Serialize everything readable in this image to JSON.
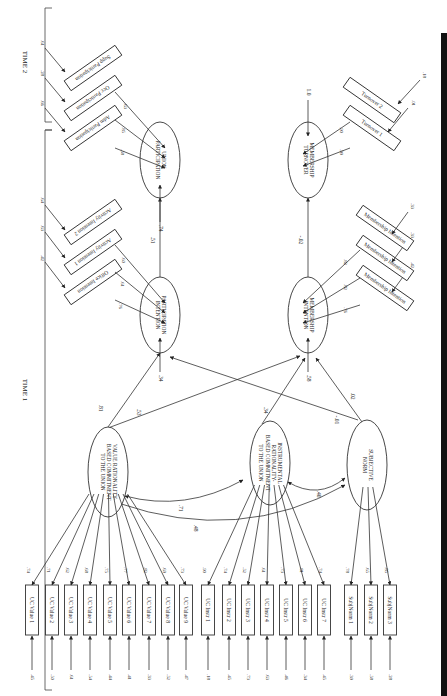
{
  "sections": {
    "time1": "TIME 1",
    "time2": "TIME 2"
  },
  "latents": {
    "value": [
      "VALUE RATIONALITY-",
      "BASED COMMITMENT",
      "TO THE UNION"
    ],
    "instr": [
      "INSTRUMENTAL",
      "RATIONALITY-",
      "BASED COMMITMENT",
      "TO THE UNION"
    ],
    "subj": [
      "SUBJECTIVE",
      "NORM"
    ],
    "partint": [
      "PARTICIPATION",
      "INTENTION"
    ],
    "memint": [
      "MEMBERSHIP",
      "INTENTION"
    ],
    "unionpart": [
      "UNION",
      "PARTICIPATION"
    ],
    "memturn": [
      "MEMBERSHIP",
      "TURNOVER"
    ]
  },
  "latent_disturbances": {
    "partint": ".34",
    "memint": ".58",
    "unionpart": ".74",
    "memturn": "1.0"
  },
  "indicators": {
    "value": [
      {
        "label": "UC Value 1",
        "loading": ".74",
        "error": ".45"
      },
      {
        "label": "UC Value 2",
        "loading": ".71",
        "error": ".50"
      },
      {
        "label": "UC Value 3",
        "loading": ".62",
        "error": ".61"
      },
      {
        "label": "UC Value 4",
        "loading": ".68",
        "error": ".54"
      },
      {
        "label": "UC Value 5",
        "loading": ".75",
        "error": ".44"
      },
      {
        "label": "UC Value 6",
        "loading": ".77",
        "error": ".41"
      },
      {
        "label": "UC Value 7",
        "loading": ".82",
        "error": ".33"
      },
      {
        "label": "UC Value 8",
        "loading": ".69",
        "error": ".52"
      },
      {
        "label": "UC Value 9",
        "loading": ".73",
        "error": ".47"
      }
    ],
    "instr": [
      {
        "label": "UC Instr 1",
        "loading": ".90",
        "error": ".18"
      },
      {
        "label": "UC Instr 2",
        "loading": ".74",
        "error": ".45"
      },
      {
        "label": "UC Instr 3",
        "loading": ".52",
        "error": ".73"
      },
      {
        "label": "UC Instr 4",
        "loading": ".61",
        "error": ".63"
      },
      {
        "label": "UC Instr 5",
        "loading": ".73",
        "error": ".46"
      },
      {
        "label": "UC Instr 6",
        "loading": ".81",
        "error": ".34"
      },
      {
        "label": "UC Instr 7",
        "loading": ".74",
        "error": ".45"
      }
    ],
    "subj": [
      {
        "label": "SubjNorm 1",
        "loading": ".78",
        "error": ".39"
      },
      {
        "label": "SubjNorm 2",
        "loading": ".65",
        "error": ".58"
      },
      {
        "label": "SubjNorm 3",
        "loading": ".85",
        "error": ".28"
      }
    ],
    "partint": [
      {
        "label": "Office Intention",
        "loading": ".76",
        "error": ".42"
      },
      {
        "label": "Activity Intention 1",
        "loading": ".61",
        "error": ".63"
      },
      {
        "label": "Activity Intention 2",
        "loading": ".60",
        "error": ".64"
      }
    ],
    "memint": [
      {
        "label": "Membership Intention",
        "loading": ".76",
        "error": ".42"
      },
      {
        "label": "Membership Intention",
        "loading": ".82",
        "error": ".33"
      },
      {
        "label": "Membership Intention",
        "loading": ".82",
        "error": ".33"
      }
    ],
    "unionpart": [
      {
        "label": "Adm Participation",
        "loading": ".58",
        "error": ".66"
      },
      {
        "label": "Occ Participation",
        "loading": ".85",
        "error": ".28"
      },
      {
        "label": "Supp Participation",
        "loading": ".63",
        "error": ".61"
      }
    ],
    "memturn": [
      {
        "label": "Turnover 1",
        "loading": ".99",
        "error": ".01"
      },
      {
        "label": "Turnover 2",
        "loading": ".90",
        "error": ".18"
      }
    ]
  },
  "paths": {
    "value_partint": ".81",
    "value_memint": ".53",
    "instr_memint": ".34",
    "subj_memint": ".02",
    "subj_partint": "-.01",
    "partint_unionpart": ".51",
    "memint_memturn": "-.02"
  },
  "correlations": {
    "value_instr": ".71",
    "value_subj": ".48",
    "instr_subj": ".40"
  }
}
